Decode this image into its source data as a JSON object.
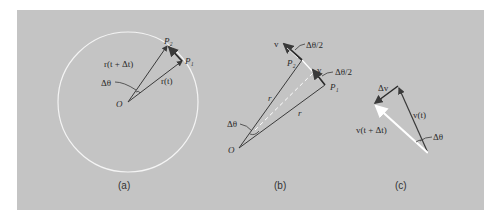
{
  "figure": {
    "background_color": "#c4c4c4",
    "line_color": "#3a3a3a",
    "highlight_color": "#ffffff",
    "panels": [
      {
        "caption": "(a)",
        "labels": {
          "p2": "P₂",
          "p1": "P₁",
          "r_t_dt": "r(t + Δt)",
          "r_t": "r(t)",
          "dtheta": "Δθ",
          "origin": "O"
        }
      },
      {
        "caption": "(b)",
        "labels": {
          "v_top": "v",
          "half_angle_top": "Δθ/2",
          "p2": "P₂",
          "v_mid": "v",
          "half_angle_mid": "Δθ/2",
          "p1": "P₁",
          "r_left": "r",
          "r_right": "r",
          "dtheta": "Δθ",
          "origin": "O"
        }
      },
      {
        "caption": "(c)",
        "labels": {
          "dv": "Δv",
          "v_t": "v(t)",
          "v_t_dt": "v(t + Δt)",
          "dtheta": "Δθ"
        }
      }
    ]
  }
}
